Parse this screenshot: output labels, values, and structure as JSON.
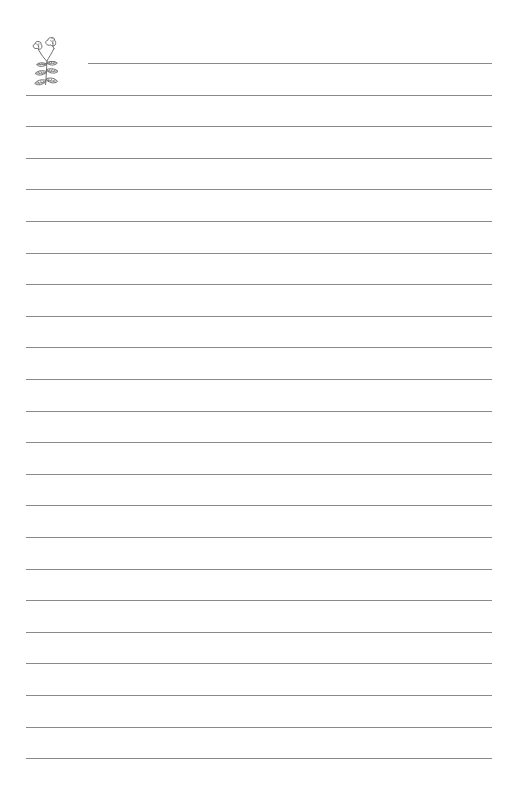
{
  "page": {
    "kind": "lined-stationery-sheet",
    "title": "Lined Notepaper Sheet",
    "width": 516,
    "height": 805,
    "background_color": "#ffffff",
    "body_text": "",
    "margin_note": ""
  },
  "decoration": {
    "name": "flower-sprig-illustration",
    "description": "Hand-drawn sprig with two tulip-like blossoms and three pairs of pointed leaves",
    "ink_color": "#6e6e6e",
    "x": 26,
    "y": 30,
    "width": 48,
    "height": 60,
    "blossom_count": 2,
    "leaf_count": 6
  },
  "ruling": {
    "line_color": "#8a8a8a",
    "line_thickness_px": 1,
    "line_count": 23,
    "first_line_y": 63,
    "line_spacing_px": 31.6,
    "left_margin_x": 26,
    "right_margin_x": 492,
    "first_line_left_x": 88,
    "lines": [
      {
        "index": 1,
        "y": 63,
        "x1": 88,
        "x2": 492,
        "indented": true,
        "text": ""
      },
      {
        "index": 2,
        "y": 95,
        "x1": 26,
        "x2": 492,
        "indented": false,
        "text": ""
      },
      {
        "index": 3,
        "y": 126,
        "x1": 26,
        "x2": 492,
        "indented": false,
        "text": ""
      },
      {
        "index": 4,
        "y": 158,
        "x1": 26,
        "x2": 492,
        "indented": false,
        "text": ""
      },
      {
        "index": 5,
        "y": 189,
        "x1": 26,
        "x2": 492,
        "indented": false,
        "text": ""
      },
      {
        "index": 6,
        "y": 221,
        "x1": 26,
        "x2": 492,
        "indented": false,
        "text": ""
      },
      {
        "index": 7,
        "y": 253,
        "x1": 26,
        "x2": 492,
        "indented": false,
        "text": ""
      },
      {
        "index": 8,
        "y": 284,
        "x1": 26,
        "x2": 492,
        "indented": false,
        "text": ""
      },
      {
        "index": 9,
        "y": 316,
        "x1": 26,
        "x2": 492,
        "indented": false,
        "text": ""
      },
      {
        "index": 10,
        "y": 347,
        "x1": 26,
        "x2": 492,
        "indented": false,
        "text": ""
      },
      {
        "index": 11,
        "y": 379,
        "x1": 26,
        "x2": 492,
        "indented": false,
        "text": ""
      },
      {
        "index": 12,
        "y": 411,
        "x1": 26,
        "x2": 492,
        "indented": false,
        "text": ""
      },
      {
        "index": 13,
        "y": 442,
        "x1": 26,
        "x2": 492,
        "indented": false,
        "text": ""
      },
      {
        "index": 14,
        "y": 474,
        "x1": 26,
        "x2": 492,
        "indented": false,
        "text": ""
      },
      {
        "index": 15,
        "y": 505,
        "x1": 26,
        "x2": 492,
        "indented": false,
        "text": ""
      },
      {
        "index": 16,
        "y": 537,
        "x1": 26,
        "x2": 492,
        "indented": false,
        "text": ""
      },
      {
        "index": 17,
        "y": 569,
        "x1": 26,
        "x2": 492,
        "indented": false,
        "text": ""
      },
      {
        "index": 18,
        "y": 600,
        "x1": 26,
        "x2": 492,
        "indented": false,
        "text": ""
      },
      {
        "index": 19,
        "y": 632,
        "x1": 26,
        "x2": 492,
        "indented": false,
        "text": ""
      },
      {
        "index": 20,
        "y": 663,
        "x1": 26,
        "x2": 492,
        "indented": false,
        "text": ""
      },
      {
        "index": 21,
        "y": 695,
        "x1": 26,
        "x2": 492,
        "indented": false,
        "text": ""
      },
      {
        "index": 22,
        "y": 727,
        "x1": 26,
        "x2": 492,
        "indented": false,
        "text": ""
      },
      {
        "index": 23,
        "y": 758,
        "x1": 26,
        "x2": 492,
        "indented": false,
        "text": ""
      }
    ]
  }
}
